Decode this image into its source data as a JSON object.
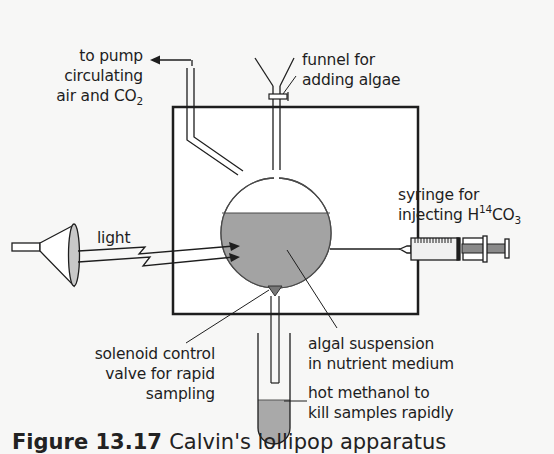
{
  "figure": {
    "caption": {
      "prefix": "Figure",
      "number": "13.17",
      "text": "Calvin's lollipop apparatus"
    },
    "colors": {
      "background": "#f7f7f6",
      "line": "#1e1e1e",
      "suspension_fill": "#a3a3a3",
      "methanol_fill": "#a9a9a9",
      "container_fill": "#ffffff",
      "lamp_lens_fill": "#c8c8c8"
    }
  },
  "labels": {
    "pump": {
      "line1": "to pump",
      "line2": "circulating",
      "line3_text": "air and CO",
      "line3_sub": "2"
    },
    "funnel": {
      "line1": "funnel for",
      "line2": "adding algae"
    },
    "light": {
      "text": "light"
    },
    "syringe": {
      "line1": "syringe for",
      "line2_text": "injecting H",
      "line2_sup": "14",
      "line2_text2": "CO",
      "line2_sub": "3"
    },
    "valve": {
      "line1": "solenoid control",
      "line2": "valve for rapid",
      "line3": "sampling"
    },
    "suspension": {
      "line1": "algal suspension",
      "line2": "in nutrient medium"
    },
    "methanol": {
      "line1": "hot methanol to",
      "line2": "kill samples rapidly"
    }
  },
  "components": [
    {
      "id": "lamp",
      "label_ref": "light"
    },
    {
      "id": "light-rays",
      "count": 2
    },
    {
      "id": "chamber",
      "shape": "square"
    },
    {
      "id": "flask",
      "shape": "round-bottom",
      "contents": "algal suspension"
    },
    {
      "id": "air-tube",
      "connects": "pump"
    },
    {
      "id": "funnel",
      "has_stopcock": true
    },
    {
      "id": "syringe",
      "injects": "H14CO3"
    },
    {
      "id": "solenoid-valve"
    },
    {
      "id": "sampling-tube"
    },
    {
      "id": "collection-tube",
      "contents": "hot methanol"
    }
  ]
}
